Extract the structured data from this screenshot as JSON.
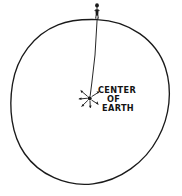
{
  "diagram": {
    "title": "Center of Earth",
    "background_color": "#ffffff",
    "ink_color": "#1a1a1a",
    "style": "vintage engraved line drawing",
    "label": {
      "line1": "CENTER",
      "line2": "OF",
      "line3": "EARTH"
    },
    "elements": {
      "earth_circle_name": "earth-circle",
      "observer_name": "observer-figure",
      "plumb_line_name": "plumb-line",
      "center_marker_name": "center-of-earth-marker"
    },
    "geometry": {
      "circle_center_x": 90,
      "circle_center_y": 101,
      "circle_radius_x": 78,
      "circle_radius_y": 82,
      "observer_x": 97,
      "observer_y": 8,
      "center_marker_x": 90,
      "center_marker_y": 98
    }
  }
}
